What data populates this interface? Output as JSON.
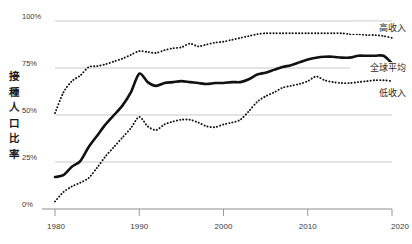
{
  "chart_data": {
    "type": "line",
    "title": "",
    "subtitle": "",
    "xlabel": "",
    "ylabel": "接種人口比率",
    "xlim": [
      1980,
      2020
    ],
    "ylim": [
      0,
      100
    ],
    "grid": true,
    "legend_position": "right-inline",
    "y_ticks": [
      {
        "value": 100,
        "label": "100%"
      },
      {
        "value": 75,
        "label": "75%"
      },
      {
        "value": 50,
        "label": "50%"
      },
      {
        "value": 25,
        "label": "25%"
      },
      {
        "value": 0,
        "label": "0%"
      }
    ],
    "x_ticks": [
      {
        "value": 1980,
        "label": "1980"
      },
      {
        "value": 1990,
        "label": "1990"
      },
      {
        "value": 2000,
        "label": "2000"
      },
      {
        "value": 2010,
        "label": "2010"
      },
      {
        "value": 2020,
        "label": "2020"
      }
    ],
    "x": [
      1980,
      1981,
      1982,
      1983,
      1984,
      1985,
      1986,
      1987,
      1988,
      1989,
      1990,
      1991,
      1992,
      1993,
      1994,
      1995,
      1996,
      1997,
      1998,
      1999,
      2000,
      2001,
      2002,
      2003,
      2004,
      2005,
      2006,
      2007,
      2008,
      2009,
      2010,
      2011,
      2012,
      2013,
      2014,
      2015,
      2016,
      2017,
      2018,
      2019,
      2020
    ],
    "series": [
      {
        "name": "高收入",
        "style": "dotted",
        "color": "#111111",
        "label_x": 2020,
        "values": [
          51,
          62,
          68,
          71,
          75.5,
          76,
          77,
          78.5,
          80,
          82,
          84,
          83.5,
          83,
          84.5,
          85.5,
          86,
          88,
          86.5,
          87.5,
          88.5,
          89,
          90,
          91,
          92,
          93,
          93.5,
          93.5,
          93.5,
          93.5,
          93.5,
          93.5,
          93.5,
          93.5,
          93.5,
          93.5,
          93,
          93,
          92.5,
          92.5,
          92,
          91
        ]
      },
      {
        "name": "全球平均",
        "style": "solid",
        "color": "#111111",
        "label_x": 2020,
        "values": [
          17,
          18,
          22.5,
          25.5,
          33,
          39,
          45,
          50,
          55,
          62,
          72,
          67.5,
          65.5,
          67,
          67.5,
          68,
          67.5,
          67,
          66.5,
          67,
          67,
          67.5,
          67.5,
          69,
          71.5,
          72.5,
          74,
          75.5,
          76.5,
          78,
          79.5,
          80.5,
          81,
          81,
          80.5,
          80.5,
          81.5,
          81.5,
          81.5,
          81.5,
          77.5
        ]
      },
      {
        "name": "低收入",
        "style": "dotted",
        "color": "#111111",
        "label_x": 2020,
        "values": [
          4,
          9,
          12,
          14,
          16.5,
          22,
          28,
          33,
          38,
          43,
          49,
          44,
          42,
          45,
          46.5,
          47.5,
          47.5,
          46,
          44,
          43.5,
          45,
          46,
          47.5,
          52,
          57,
          60,
          62,
          64.5,
          65.5,
          66.5,
          68,
          70.5,
          68.5,
          67.5,
          67,
          67,
          67.5,
          68,
          68.5,
          68.5,
          68
        ]
      }
    ],
    "legend": [
      {
        "label": "高收入",
        "y_value": 96.5
      },
      {
        "label": "全球平均",
        "y_value": 75
      },
      {
        "label": "低收入",
        "y_value": 62
      }
    ]
  }
}
